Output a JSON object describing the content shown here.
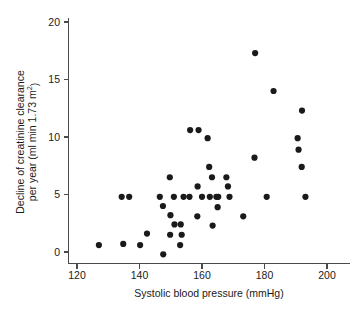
{
  "figure": {
    "background_color": "#ffffff",
    "ink_color": "#1a1a1a",
    "axis_color": "#4a4a4a",
    "cropped_header_text": "",
    "point_radius": 3.1
  },
  "axes": {
    "x": {
      "title": "Systolic blood pressure (mmHg)",
      "ticks": [
        120,
        140,
        160,
        180,
        200
      ],
      "tick_labels": [
        "120",
        "140",
        "160",
        "180",
        "200"
      ],
      "min": 117,
      "max": 203
    },
    "y": {
      "title_line1": "Decline of creatinine clearance",
      "title_line2_pre": "per year (ml min 1.73 m",
      "title_line2_sup": "2",
      "title_line2_post": ")",
      "ticks": [
        0,
        5,
        10,
        15,
        20
      ],
      "tick_labels": [
        "0",
        "5",
        "10",
        "15",
        "20"
      ],
      "min": -1.2,
      "max": 20.8
    }
  },
  "chart_data": {
    "type": "scatter",
    "title": "",
    "xlabel": "Systolic blood pressure (mmHg)",
    "ylabel": "Decline of creatinine clearance per year (ml min 1.73 m2)",
    "xlim": [
      117,
      203
    ],
    "ylim": [
      -1.2,
      20.8
    ],
    "xticks": [
      120,
      140,
      160,
      180,
      200
    ],
    "yticks": [
      0,
      5,
      10,
      15,
      20
    ],
    "grid": false,
    "legend": null,
    "marker": "filled-circle",
    "marker_color": "#1a1a1a",
    "n_points": 45,
    "points": [
      {
        "x": 127.0,
        "y": 0.6
      },
      {
        "x": 134.3,
        "y": 4.8
      },
      {
        "x": 136.7,
        "y": 4.8
      },
      {
        "x": 134.8,
        "y": 0.7
      },
      {
        "x": 140.2,
        "y": 0.6
      },
      {
        "x": 142.4,
        "y": 1.6
      },
      {
        "x": 147.5,
        "y": 4.0
      },
      {
        "x": 147.6,
        "y": -0.2
      },
      {
        "x": 149.7,
        "y": 6.5
      },
      {
        "x": 149.9,
        "y": 3.2
      },
      {
        "x": 149.8,
        "y": 1.5
      },
      {
        "x": 151.2,
        "y": 2.4
      },
      {
        "x": 153.2,
        "y": 2.4
      },
      {
        "x": 153.0,
        "y": 0.6
      },
      {
        "x": 153.5,
        "y": 1.5
      },
      {
        "x": 154.1,
        "y": 4.8
      },
      {
        "x": 156.0,
        "y": 4.8
      },
      {
        "x": 156.2,
        "y": 10.6
      },
      {
        "x": 158.9,
        "y": 10.6
      },
      {
        "x": 158.6,
        "y": 5.7
      },
      {
        "x": 158.5,
        "y": 3.1
      },
      {
        "x": 161.8,
        "y": 9.9
      },
      {
        "x": 162.3,
        "y": 7.4
      },
      {
        "x": 162.5,
        "y": 4.8
      },
      {
        "x": 163.2,
        "y": 6.5
      },
      {
        "x": 163.4,
        "y": 2.3
      },
      {
        "x": 165.2,
        "y": 4.8
      },
      {
        "x": 165.0,
        "y": 3.9
      },
      {
        "x": 167.8,
        "y": 6.5
      },
      {
        "x": 168.3,
        "y": 5.7
      },
      {
        "x": 173.2,
        "y": 3.1
      },
      {
        "x": 177.0,
        "y": 17.3
      },
      {
        "x": 176.8,
        "y": 8.2
      },
      {
        "x": 180.7,
        "y": 4.8
      },
      {
        "x": 182.9,
        "y": 14.0
      },
      {
        "x": 190.6,
        "y": 9.9
      },
      {
        "x": 190.9,
        "y": 8.9
      },
      {
        "x": 192.0,
        "y": 12.3
      },
      {
        "x": 191.9,
        "y": 7.4
      },
      {
        "x": 193.1,
        "y": 4.8
      },
      {
        "x": 164.6,
        "y": 4.8
      },
      {
        "x": 160.0,
        "y": 4.8
      },
      {
        "x": 151.0,
        "y": 4.8
      },
      {
        "x": 146.5,
        "y": 4.8
      },
      {
        "x": 168.8,
        "y": 4.8
      }
    ]
  }
}
